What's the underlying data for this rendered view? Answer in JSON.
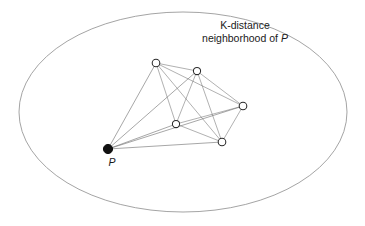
{
  "figure": {
    "type": "diagram",
    "title_lines": [
      "K-distance",
      "neighborhood of P"
    ],
    "caption_line1": "K-distance",
    "caption_line2_prefix": "neighborhood of ",
    "caption_line2_var": "P",
    "point_label": "P",
    "background_color": "#ffffff",
    "ellipse_stroke": "#9a9a9a",
    "edge_color": "#6f6f6f",
    "node_stroke": "#2a2a2a",
    "node_fill": "#ffffff",
    "focal_node_fill": "#111111"
  },
  "chart_data": {
    "type": "scatter",
    "title": "K-distance neighborhood of P",
    "xlabel": "",
    "ylabel": "",
    "boundary": {
      "shape": "ellipse",
      "cx": 183,
      "cy": 112,
      "rx": 164,
      "ry": 100,
      "label": "K-distance neighborhood of P"
    },
    "nodes": [
      {
        "id": "P",
        "x": 108,
        "y": 149,
        "r": 4.6,
        "filled": true,
        "label": "P"
      },
      {
        "id": "n1",
        "x": 156,
        "y": 63,
        "r": 3.8,
        "filled": false,
        "label": ""
      },
      {
        "id": "n2",
        "x": 197,
        "y": 71,
        "r": 3.6,
        "filled": false,
        "label": ""
      },
      {
        "id": "n3",
        "x": 243,
        "y": 106,
        "r": 3.8,
        "filled": false,
        "label": ""
      },
      {
        "id": "n4",
        "x": 176,
        "y": 124,
        "r": 3.6,
        "filled": false,
        "label": ""
      },
      {
        "id": "n5",
        "x": 222,
        "y": 142,
        "r": 3.8,
        "filled": false,
        "label": ""
      }
    ],
    "edges": [
      [
        "P",
        "n1"
      ],
      [
        "P",
        "n2"
      ],
      [
        "P",
        "n3"
      ],
      [
        "P",
        "n4"
      ],
      [
        "P",
        "n5"
      ],
      [
        "n1",
        "n2"
      ],
      [
        "n1",
        "n3"
      ],
      [
        "n1",
        "n4"
      ],
      [
        "n1",
        "n5"
      ],
      [
        "n2",
        "n3"
      ],
      [
        "n2",
        "n4"
      ],
      [
        "n2",
        "n5"
      ],
      [
        "n3",
        "n4"
      ],
      [
        "n3",
        "n5"
      ],
      [
        "n4",
        "n5"
      ]
    ],
    "annotations": [
      {
        "text": "K-distance",
        "x": 245,
        "y": 26
      },
      {
        "text": "neighborhood of P",
        "x": 245,
        "y": 39
      },
      {
        "text": "P",
        "x": 112,
        "y": 163
      }
    ],
    "legend": null,
    "grid": false
  }
}
